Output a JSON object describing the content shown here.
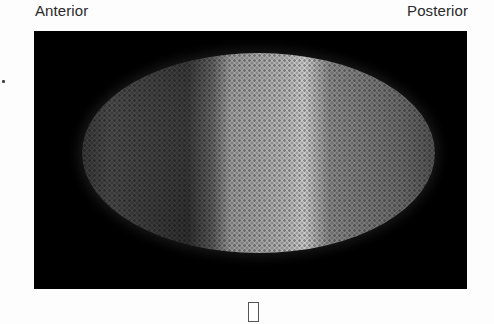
{
  "labels": {
    "left": "Anterior",
    "right": "Posterior"
  },
  "image": {
    "subject": "embryo-fluorescence-micrograph",
    "background_color": "#000000"
  }
}
